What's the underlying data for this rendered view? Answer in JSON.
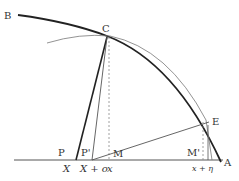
{
  "diagram": {
    "colors": {
      "stroke": "#222222",
      "thin": "#555555",
      "dashed": "#888888",
      "label": "#333333"
    },
    "points": {
      "B": {
        "label": "B"
      },
      "C": {
        "label": "C"
      },
      "E": {
        "label": "E"
      },
      "A": {
        "label": "A"
      },
      "P": {
        "label": "P"
      },
      "P_prime": {
        "label": "P'"
      },
      "M": {
        "label": "M"
      },
      "M_prime": {
        "label": "M'"
      }
    },
    "axis_labels": {
      "X": "X",
      "X_plus_o": "X + o",
      "x": "x",
      "x_plus_eta": "x + η"
    }
  }
}
